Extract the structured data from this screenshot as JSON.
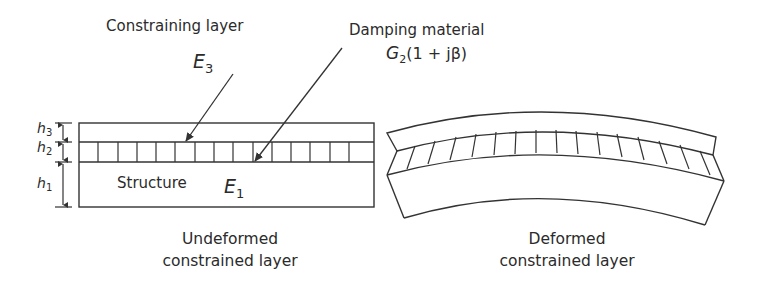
{
  "labels": {
    "constraining_layer": "Constraining layer",
    "e3_symbol": "E",
    "e3_subscript": "3",
    "damping_material": "Damping material",
    "damping_formula_g": "G",
    "damping_formula_sub": "2",
    "damping_formula_rest": "(1 + jβ)",
    "structure": "Structure",
    "e1_symbol": "E",
    "e1_subscript": "1"
  },
  "dimensions": [
    {
      "symbol": "h",
      "subscript": "3"
    },
    {
      "symbol": "h",
      "subscript": "2"
    },
    {
      "symbol": "h",
      "subscript": "1"
    }
  ],
  "captions": {
    "undeformed_line1": "Undeformed",
    "undeformed_line2": "constrained layer",
    "deformed_line1": "Deformed",
    "deformed_line2": "constrained layer"
  },
  "colors": {
    "line": "#333333",
    "text": "#2b2b2b",
    "background": "#ffffff"
  }
}
